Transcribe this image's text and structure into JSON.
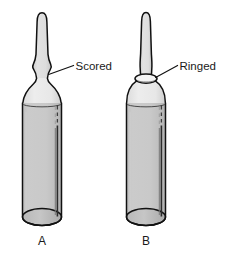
{
  "figure": {
    "kind": "line-drawing",
    "background_color": "#ffffff",
    "outline_color": "#111111",
    "glass_body_color": "#c8c8c8",
    "glass_stem_color": "#d9d9d9",
    "shoulder_color": "#e6e6e6",
    "highlight_dark": "#2b2b2b",
    "highlight_light": "#8c8c8c",
    "text_color": "#1a1a1a"
  },
  "specimens": [
    {
      "id": "A",
      "letter_label": "A",
      "neck_type": "Scored",
      "callout_label": "Scored",
      "description": "ampule with a scored neck constriction"
    },
    {
      "id": "B",
      "letter_label": "B",
      "neck_type": "Ringed",
      "callout_label": "Ringed",
      "description": "ampule with a painted ring band at the neck"
    }
  ],
  "callouts": [
    {
      "label": "Scored",
      "points_to": "neck-of-ampule-a"
    },
    {
      "label": "Ringed",
      "points_to": "neck-of-ampule-b"
    }
  ]
}
